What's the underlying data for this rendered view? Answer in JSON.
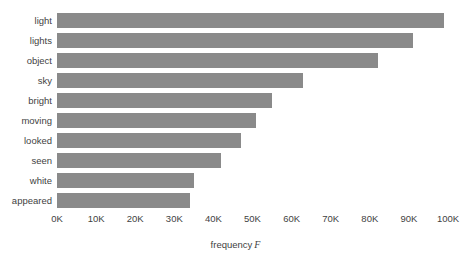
{
  "chart_data": {
    "type": "bar",
    "orientation": "horizontal",
    "title": "",
    "xlabel": "frequency F",
    "xlabel_text": "frequency",
    "xlabel_symbol": "F",
    "ylabel": "",
    "categories": [
      "light",
      "lights",
      "object",
      "sky",
      "bright",
      "moving",
      "looked",
      "seen",
      "white",
      "appeared"
    ],
    "values": [
      99000,
      91000,
      82000,
      63000,
      55000,
      51000,
      47000,
      42000,
      35000,
      34000
    ],
    "xlim": [
      0,
      100000
    ],
    "xticks": [
      0,
      10000,
      20000,
      30000,
      40000,
      50000,
      60000,
      70000,
      80000,
      90000,
      100000
    ],
    "xtick_labels": [
      "0K",
      "10K",
      "20K",
      "30K",
      "40K",
      "50K",
      "60K",
      "70K",
      "80K",
      "90K",
      "100K"
    ],
    "grid": false,
    "legend": null,
    "bar_color": "#8a8a8a",
    "background_color": "#ffffff",
    "text_color": "#3f3f3f"
  }
}
